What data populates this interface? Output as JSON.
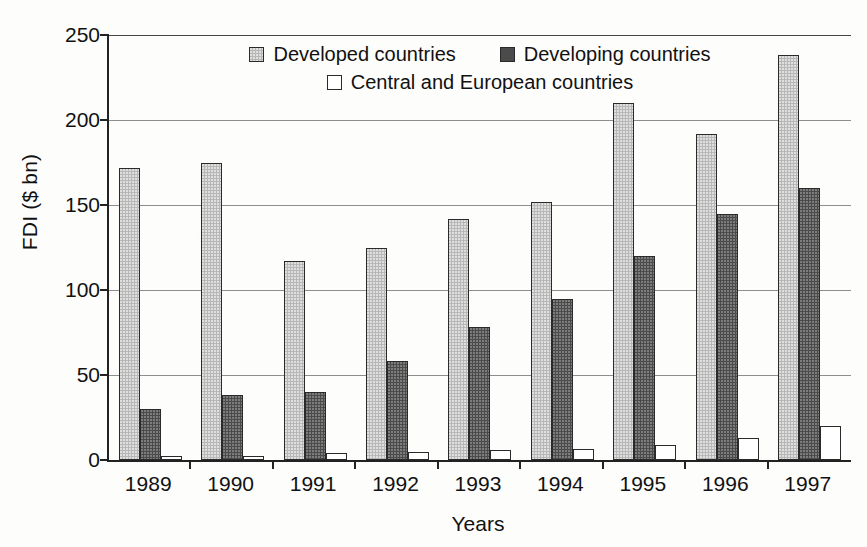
{
  "chart_data": {
    "type": "bar",
    "title": "",
    "xlabel": "Years",
    "ylabel": "FDI ($ bn)",
    "categories": [
      "1989",
      "1990",
      "1991",
      "1992",
      "1993",
      "1994",
      "1995",
      "1996",
      "1997"
    ],
    "ylim": [
      0,
      250
    ],
    "yticks": [
      0,
      50,
      100,
      150,
      200,
      250
    ],
    "grid": "horizontal",
    "legend_position": "top-inside",
    "series": [
      {
        "name": "Developed countries",
        "color": "#b7b7b7",
        "values": [
          172,
          175,
          117,
          125,
          142,
          152,
          210,
          192,
          238
        ]
      },
      {
        "name": "Developing countries",
        "color": "#4b4b4b",
        "values": [
          30,
          38,
          40,
          58,
          78,
          95,
          120,
          145,
          160
        ]
      },
      {
        "name": "Central and European countries",
        "color": "#ffffff",
        "values": [
          2.5,
          2.5,
          4,
          5,
          6,
          6.5,
          9,
          13,
          20
        ]
      }
    ]
  },
  "axes": {
    "y_title": "FDI ($ bn)",
    "x_title": "Years",
    "y_tick_labels": [
      "250",
      "200",
      "150",
      "100",
      "50",
      "0"
    ],
    "x_tick_labels": [
      "1989",
      "1990",
      "1991",
      "1992",
      "1993",
      "1994",
      "1995",
      "1996",
      "1997"
    ]
  },
  "legend": {
    "row1": [
      {
        "label": "Developed countries",
        "swatch": "developed"
      },
      {
        "label": "Developing countries",
        "swatch": "developing"
      }
    ],
    "row2": [
      {
        "label": "Central and European countries",
        "swatch": "central"
      }
    ]
  },
  "colors": {
    "developed": "#b7b7b7",
    "developing": "#4b4b4b",
    "central": "#ffffff",
    "axis": "#222222",
    "gridline": "#8e8e8e",
    "background": "#fdfdfc"
  }
}
